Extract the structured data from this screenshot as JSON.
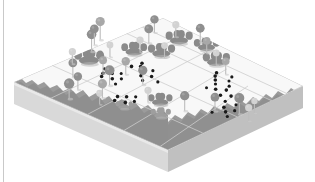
{
  "figure": {
    "title": "Isometric terrain parcel with survey grid",
    "background_color": "#ffffff",
    "left_rule_color": "#c9c9c9"
  },
  "palette": {
    "plot_top": "#f7f7f7",
    "plot_top_shade": "#efefef",
    "grid_line": "#cfcfcf",
    "slab_front_left": "#d8d8d8",
    "slab_front_right": "#c2c2c2",
    "slab_top_rim": "#e8e8e8",
    "terrain_dark": "#9a9a9a",
    "terrain_mid": "#ababab",
    "tree_dark": "#8f8f8f",
    "tree_mid": "#a8a8a8",
    "tree_light": "#d2d2d2",
    "stem": "#bdbdbd",
    "shrub_dark": "#8a8a8a",
    "shrub_mid": "#9e9e9e",
    "dot": "#1a1a1a"
  },
  "geometry": {
    "plot_corners": {
      "top": [
        163,
        18
      ],
      "right": [
        303,
        86
      ],
      "bottom": [
        168,
        150
      ],
      "left": [
        14,
        82
      ]
    },
    "slab_depth": 22,
    "grid_divisions_u": 4,
    "grid_divisions_v": 4
  },
  "chart_data": {
    "type": "scatter",
    "title": "Isometric terrain parcel with survey grid",
    "xlabel": "",
    "ylabel": "",
    "legend": [],
    "grid": true,
    "series": [
      {
        "name": "round-trees",
        "marker": "circle-on-stem",
        "count": 29,
        "points": [
          {
            "u": 0.06,
            "v": 0.3,
            "r": 5.2,
            "h": 15,
            "tone": "dark"
          },
          {
            "u": 0.16,
            "v": 0.26,
            "r": 4.2,
            "h": 13,
            "tone": "dark"
          },
          {
            "u": 0.18,
            "v": 0.4,
            "r": 4.6,
            "h": 14,
            "tone": "mid"
          },
          {
            "u": 0.24,
            "v": 0.15,
            "r": 4.4,
            "h": 14,
            "tone": "dark"
          },
          {
            "u": 0.3,
            "v": 0.33,
            "r": 5.0,
            "h": 15,
            "tone": "dark"
          },
          {
            "u": 0.34,
            "v": 0.05,
            "r": 3.6,
            "h": 12,
            "tone": "light"
          },
          {
            "u": 0.37,
            "v": 0.22,
            "r": 4.0,
            "h": 13,
            "tone": "mid"
          },
          {
            "u": 0.42,
            "v": 0.43,
            "r": 4.6,
            "h": 14,
            "tone": "dark"
          },
          {
            "u": 0.44,
            "v": 0.3,
            "r": 4.2,
            "h": 13,
            "tone": "mid"
          },
          {
            "u": 0.5,
            "v": 0.02,
            "r": 4.8,
            "h": 17,
            "tone": "dark"
          },
          {
            "u": 0.56,
            "v": -0.02,
            "r": 4.4,
            "h": 16,
            "tone": "dark"
          },
          {
            "u": 0.62,
            "v": -0.04,
            "r": 4.6,
            "h": 18,
            "tone": "mid"
          },
          {
            "u": 0.52,
            "v": 0.12,
            "r": 3.4,
            "h": 12,
            "tone": "light"
          },
          {
            "u": 0.66,
            "v": 0.18,
            "r": 3.6,
            "h": 12,
            "tone": "light"
          },
          {
            "u": 0.7,
            "v": 0.3,
            "r": 3.4,
            "h": 12,
            "tone": "light"
          },
          {
            "u": 0.76,
            "v": 0.14,
            "r": 4.4,
            "h": 14,
            "tone": "dark"
          },
          {
            "u": 0.86,
            "v": 0.08,
            "r": 4.2,
            "h": 13,
            "tone": "dark"
          },
          {
            "u": 0.9,
            "v": 0.18,
            "r": 3.6,
            "h": 12,
            "tone": "light"
          },
          {
            "u": 0.94,
            "v": 0.3,
            "r": 4.4,
            "h": 14,
            "tone": "dark"
          },
          {
            "u": 0.88,
            "v": 0.4,
            "r": 3.8,
            "h": 12,
            "tone": "mid"
          },
          {
            "u": 0.82,
            "v": 0.52,
            "r": 3.4,
            "h": 12,
            "tone": "light"
          },
          {
            "u": 0.78,
            "v": 0.62,
            "r": 3.8,
            "h": 13,
            "tone": "mid"
          },
          {
            "u": 0.3,
            "v": 0.58,
            "r": 3.6,
            "h": 12,
            "tone": "light"
          },
          {
            "u": 0.36,
            "v": 0.76,
            "r": 4.6,
            "h": 15,
            "tone": "dark"
          },
          {
            "u": 0.46,
            "v": 0.86,
            "r": 4.4,
            "h": 14,
            "tone": "dark"
          },
          {
            "u": 0.52,
            "v": 0.96,
            "r": 5.0,
            "h": 16,
            "tone": "dark"
          },
          {
            "u": 0.5,
            "v": 1.04,
            "r": 3.6,
            "h": 13,
            "tone": "light"
          },
          {
            "u": 0.58,
            "v": 1.0,
            "r": 3.2,
            "h": 12,
            "tone": "light"
          },
          {
            "u": 0.12,
            "v": 0.44,
            "r": 3.4,
            "h": 11,
            "tone": "light"
          }
        ]
      },
      {
        "name": "shrub-clusters",
        "marker": "bushy-blob",
        "count": 9,
        "points": [
          {
            "u": 0.42,
            "v": 0.08,
            "w": 20,
            "tone": "dark"
          },
          {
            "u": 0.64,
            "v": 0.16,
            "w": 17,
            "tone": "dark"
          },
          {
            "u": 0.72,
            "v": 0.26,
            "w": 18,
            "tone": "dark"
          },
          {
            "u": 0.88,
            "v": 0.22,
            "w": 18,
            "tone": "dark"
          },
          {
            "u": 0.92,
            "v": 0.36,
            "w": 17,
            "tone": "dark"
          },
          {
            "u": 0.84,
            "v": 0.5,
            "w": 18,
            "tone": "dark"
          },
          {
            "u": 0.34,
            "v": 0.62,
            "w": 16,
            "tone": "dark"
          },
          {
            "u": 0.24,
            "v": 0.72,
            "w": 13,
            "tone": "mid"
          },
          {
            "u": 0.18,
            "v": 0.54,
            "w": 11,
            "tone": "mid"
          }
        ]
      },
      {
        "name": "point-samples",
        "marker": "dot",
        "count": 44,
        "points": [
          {
            "u": 0.34,
            "v": 0.24,
            "r": 1.8
          },
          {
            "u": 0.37,
            "v": 0.22,
            "r": 1.8
          },
          {
            "u": 0.4,
            "v": 0.25,
            "r": 1.8
          },
          {
            "u": 0.36,
            "v": 0.29,
            "r": 1.8
          },
          {
            "u": 0.39,
            "v": 0.32,
            "r": 1.6
          },
          {
            "u": 0.33,
            "v": 0.34,
            "r": 1.6
          },
          {
            "u": 0.41,
            "v": 0.19,
            "r": 1.5
          },
          {
            "u": 0.52,
            "v": 0.26,
            "r": 1.8
          },
          {
            "u": 0.55,
            "v": 0.29,
            "r": 1.8
          },
          {
            "u": 0.58,
            "v": 0.27,
            "r": 1.8
          },
          {
            "u": 0.53,
            "v": 0.33,
            "r": 1.6
          },
          {
            "u": 0.56,
            "v": 0.36,
            "r": 1.6
          },
          {
            "u": 0.48,
            "v": 0.36,
            "r": 1.8
          },
          {
            "u": 0.51,
            "v": 0.4,
            "r": 1.8
          },
          {
            "u": 0.45,
            "v": 0.4,
            "r": 1.6
          },
          {
            "u": 0.49,
            "v": 0.46,
            "r": 1.6
          },
          {
            "u": 0.2,
            "v": 0.46,
            "r": 1.8
          },
          {
            "u": 0.24,
            "v": 0.44,
            "r": 1.8
          },
          {
            "u": 0.27,
            "v": 0.47,
            "r": 1.8
          },
          {
            "u": 0.22,
            "v": 0.51,
            "r": 1.8
          },
          {
            "u": 0.26,
            "v": 0.53,
            "r": 1.6
          },
          {
            "u": 0.3,
            "v": 0.5,
            "r": 1.6
          },
          {
            "u": 0.73,
            "v": 0.6,
            "r": 1.8
          },
          {
            "u": 0.76,
            "v": 0.58,
            "r": 1.8
          },
          {
            "u": 0.7,
            "v": 0.63,
            "r": 1.8
          },
          {
            "u": 0.67,
            "v": 0.66,
            "r": 1.6
          },
          {
            "u": 0.63,
            "v": 0.7,
            "r": 1.8
          },
          {
            "u": 0.66,
            "v": 0.74,
            "r": 1.8
          },
          {
            "u": 0.7,
            "v": 0.72,
            "r": 1.6
          },
          {
            "u": 0.6,
            "v": 0.76,
            "r": 1.8
          },
          {
            "u": 0.63,
            "v": 0.8,
            "r": 1.8
          },
          {
            "u": 0.57,
            "v": 0.82,
            "r": 1.6
          },
          {
            "u": 0.55,
            "v": 0.76,
            "r": 1.6
          },
          {
            "u": 0.52,
            "v": 0.86,
            "r": 1.8
          },
          {
            "u": 0.49,
            "v": 0.9,
            "r": 1.8
          },
          {
            "u": 0.53,
            "v": 0.92,
            "r": 1.6
          },
          {
            "u": 0.46,
            "v": 0.94,
            "r": 1.6
          },
          {
            "u": 0.58,
            "v": 0.88,
            "r": 1.5
          },
          {
            "u": 0.44,
            "v": 0.86,
            "r": 1.5
          },
          {
            "u": 0.78,
            "v": 0.66,
            "r": 1.6
          },
          {
            "u": 0.74,
            "v": 0.68,
            "r": 1.5
          },
          {
            "u": 0.61,
            "v": 0.66,
            "r": 1.5
          },
          {
            "u": 0.43,
            "v": 0.28,
            "r": 1.5
          },
          {
            "u": 0.31,
            "v": 0.28,
            "r": 1.5
          }
        ]
      }
    ]
  }
}
